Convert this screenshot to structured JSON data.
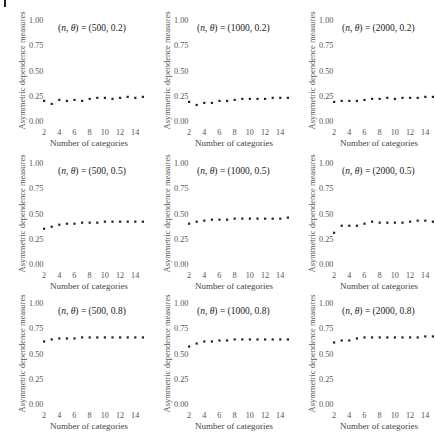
{
  "figure": {
    "ylabel": "Asymmetric dependence measures",
    "xlabel": "Number of categories",
    "yticks": [
      "0.00",
      "0.25",
      "0.50",
      "0.75",
      "1.00"
    ],
    "xticks": [
      "2",
      "4",
      "6",
      "8",
      "10",
      "12",
      "14"
    ]
  },
  "chart_data": [
    {
      "type": "scatter",
      "title": "(n, θ) = (500, 0.2)",
      "n": 500,
      "theta": 0.2,
      "xlabel": "Number of categories",
      "ylabel": "Asymmetric dependence measures",
      "x": [
        2,
        3,
        4,
        5,
        6,
        7,
        8,
        9,
        10,
        11,
        12,
        13,
        14,
        15
      ],
      "y": [
        0.2,
        0.17,
        0.21,
        0.2,
        0.21,
        0.2,
        0.22,
        0.23,
        0.23,
        0.22,
        0.23,
        0.24,
        0.23,
        0.24
      ],
      "ylim": [
        0,
        1
      ],
      "xlim": [
        2,
        15
      ]
    },
    {
      "type": "scatter",
      "title": "(n, θ) = (1000, 0.2)",
      "n": 1000,
      "theta": 0.2,
      "xlabel": "Number of categories",
      "ylabel": "Asymmetric dependence measures",
      "x": [
        2,
        3,
        4,
        5,
        6,
        7,
        8,
        9,
        10,
        11,
        12,
        13,
        14,
        15
      ],
      "y": [
        0.19,
        0.16,
        0.18,
        0.18,
        0.2,
        0.2,
        0.21,
        0.22,
        0.22,
        0.22,
        0.22,
        0.23,
        0.23,
        0.23
      ],
      "ylim": [
        0,
        1
      ],
      "xlim": [
        2,
        15
      ]
    },
    {
      "type": "scatter",
      "title": "(n, θ) = (2000, 0.2)",
      "n": 2000,
      "theta": 0.2,
      "xlabel": "Number of categories",
      "ylabel": "Asymmetric dependence measures",
      "x": [
        2,
        3,
        4,
        5,
        6,
        7,
        8,
        9,
        10,
        11,
        12,
        13,
        14,
        15
      ],
      "y": [
        0.19,
        0.2,
        0.2,
        0.2,
        0.21,
        0.22,
        0.22,
        0.23,
        0.22,
        0.23,
        0.23,
        0.23,
        0.24,
        0.24
      ],
      "ylim": [
        0,
        1
      ],
      "xlim": [
        2,
        15
      ]
    },
    {
      "type": "scatter",
      "title": "(n, θ) = (500, 0.5)",
      "n": 500,
      "theta": 0.5,
      "xlabel": "Number of categories",
      "ylabel": "Asymmetric dependence measures",
      "x": [
        2,
        3,
        4,
        5,
        6,
        7,
        8,
        9,
        10,
        11,
        12,
        13,
        14,
        15
      ],
      "y": [
        0.35,
        0.37,
        0.39,
        0.4,
        0.4,
        0.41,
        0.41,
        0.41,
        0.42,
        0.42,
        0.42,
        0.42,
        0.42,
        0.42
      ],
      "ylim": [
        0,
        1
      ],
      "xlim": [
        2,
        15
      ]
    },
    {
      "type": "scatter",
      "title": "(n, θ) = (1000, 0.5)",
      "n": 1000,
      "theta": 0.5,
      "xlabel": "Number of categories",
      "ylabel": "Asymmetric dependence measures",
      "x": [
        2,
        3,
        4,
        5,
        6,
        7,
        8,
        9,
        10,
        11,
        12,
        13,
        14,
        15
      ],
      "y": [
        0.4,
        0.42,
        0.43,
        0.44,
        0.44,
        0.44,
        0.45,
        0.45,
        0.45,
        0.45,
        0.45,
        0.45,
        0.45,
        0.46
      ],
      "ylim": [
        0,
        1
      ],
      "xlim": [
        2,
        15
      ]
    },
    {
      "type": "scatter",
      "title": "(n, θ) = (2000, 0.5)",
      "n": 2000,
      "theta": 0.5,
      "xlabel": "Number of categories",
      "ylabel": "Asymmetric dependence measures",
      "x": [
        2,
        3,
        4,
        5,
        6,
        7,
        8,
        9,
        10,
        11,
        12,
        13,
        14,
        15
      ],
      "y": [
        0.31,
        0.38,
        0.38,
        0.38,
        0.4,
        0.42,
        0.41,
        0.41,
        0.41,
        0.41,
        0.42,
        0.43,
        0.43,
        0.42
      ],
      "ylim": [
        0,
        1
      ],
      "xlim": [
        2,
        15
      ]
    },
    {
      "type": "scatter",
      "title": "(n, θ) = (500, 0.8)",
      "n": 500,
      "theta": 0.8,
      "xlabel": "Number of categories",
      "ylabel": "Asymmetric dependence measures",
      "x": [
        2,
        3,
        4,
        5,
        6,
        7,
        8,
        9,
        10,
        11,
        12,
        13,
        14,
        15
      ],
      "y": [
        0.62,
        0.64,
        0.65,
        0.65,
        0.65,
        0.66,
        0.66,
        0.66,
        0.66,
        0.66,
        0.66,
        0.66,
        0.66,
        0.66
      ],
      "ylim": [
        0,
        1
      ],
      "xlim": [
        2,
        15
      ]
    },
    {
      "type": "scatter",
      "title": "(n, θ) = (1000, 0.8)",
      "n": 1000,
      "theta": 0.8,
      "xlabel": "Number of categories",
      "ylabel": "Asymmetric dependence measures",
      "x": [
        2,
        3,
        4,
        5,
        6,
        7,
        8,
        9,
        10,
        11,
        12,
        13,
        14,
        15
      ],
      "y": [
        0.57,
        0.6,
        0.62,
        0.62,
        0.63,
        0.63,
        0.64,
        0.64,
        0.64,
        0.64,
        0.64,
        0.64,
        0.64,
        0.64
      ],
      "ylim": [
        0,
        1
      ],
      "xlim": [
        2,
        15
      ]
    },
    {
      "type": "scatter",
      "title": "(n, θ) = (2000, 0.8)",
      "n": 2000,
      "theta": 0.8,
      "xlabel": "Number of categories",
      "ylabel": "Asymmetric dependence measures",
      "x": [
        2,
        3,
        4,
        5,
        6,
        7,
        8,
        9,
        10,
        11,
        12,
        13,
        14,
        15
      ],
      "y": [
        0.61,
        0.63,
        0.63,
        0.65,
        0.66,
        0.66,
        0.66,
        0.66,
        0.66,
        0.66,
        0.66,
        0.66,
        0.67,
        0.67
      ],
      "ylim": [
        0,
        1
      ],
      "xlim": [
        2,
        15
      ]
    }
  ]
}
